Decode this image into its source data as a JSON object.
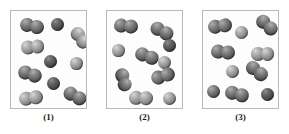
{
  "figure": {
    "kind": "molecular-diagram",
    "background_color": "#ffffff",
    "panel_border_color": "#b9b9b9",
    "panel_fill_color": "#fdfdfd",
    "atom_colors": {
      "medium": "#6a6a6a",
      "light": "#909090",
      "dark": "#4a4a4a"
    },
    "panel_count": 3
  },
  "panels": [
    {
      "id": "panel-1",
      "caption": "(1)",
      "box": {
        "x": 10,
        "y": 10,
        "w": 77,
        "h": 99
      },
      "caption_box": {
        "x": 10,
        "y": 112,
        "w": 77
      },
      "particles": [
        {
          "type": "diatomic",
          "x": 9,
          "y": 8,
          "r": 7.0,
          "angle": 12,
          "shade": "medium"
        },
        {
          "type": "single",
          "x": 40,
          "y": 7,
          "r": 6.6,
          "shade": "dark"
        },
        {
          "type": "diatomic",
          "x": 58,
          "y": 20,
          "r": 6.8,
          "angle": 55,
          "shade": "light"
        },
        {
          "type": "diatomic",
          "x": 10,
          "y": 29,
          "r": 6.8,
          "angle": -5,
          "shade": "light"
        },
        {
          "type": "single",
          "x": 33,
          "y": 44,
          "r": 6.6,
          "shade": "dark"
        },
        {
          "type": "single",
          "x": 59,
          "y": 46,
          "r": 6.4,
          "shade": "light"
        },
        {
          "type": "diatomic",
          "x": 7,
          "y": 56,
          "r": 6.9,
          "angle": 18,
          "shade": "medium"
        },
        {
          "type": "single",
          "x": 36,
          "y": 66,
          "r": 6.6,
          "shade": "dark"
        },
        {
          "type": "diatomic",
          "x": 8,
          "y": 80,
          "r": 6.9,
          "angle": -8,
          "shade": "light"
        },
        {
          "type": "diatomic",
          "x": 52,
          "y": 78,
          "r": 7.0,
          "angle": 28,
          "shade": "medium"
        }
      ]
    },
    {
      "id": "panel-2",
      "caption": "(2)",
      "box": {
        "x": 106,
        "y": 10,
        "w": 77,
        "h": 99
      },
      "caption_box": {
        "x": 106,
        "y": 112,
        "w": 77
      },
      "particles": [
        {
          "type": "diatomic",
          "x": 7,
          "y": 8,
          "r": 7.0,
          "angle": 5,
          "shade": "medium"
        },
        {
          "type": "diatomic",
          "x": 43,
          "y": 13,
          "r": 6.9,
          "angle": 28,
          "shade": "medium"
        },
        {
          "type": "single",
          "x": 5,
          "y": 33,
          "r": 6.4,
          "shade": "light"
        },
        {
          "type": "single",
          "x": 56,
          "y": 28,
          "r": 6.6,
          "shade": "dark"
        },
        {
          "type": "diatomic",
          "x": 28,
          "y": 38,
          "r": 6.9,
          "angle": 20,
          "shade": "medium"
        },
        {
          "type": "single",
          "x": 51,
          "y": 45,
          "r": 6.5,
          "shade": "light"
        },
        {
          "type": "diatomic",
          "x": 44,
          "y": 58,
          "r": 6.9,
          "angle": -18,
          "shade": "medium"
        },
        {
          "type": "diatomic",
          "x": 5,
          "y": 62,
          "r": 6.8,
          "angle": 75,
          "shade": "medium"
        },
        {
          "type": "diatomic",
          "x": 22,
          "y": 80,
          "r": 6.9,
          "angle": 2,
          "shade": "light"
        },
        {
          "type": "single",
          "x": 56,
          "y": 81,
          "r": 6.5,
          "shade": "light"
        }
      ]
    },
    {
      "id": "panel-3",
      "caption": "(3)",
      "box": {
        "x": 202,
        "y": 10,
        "w": 77,
        "h": 99
      },
      "caption_box": {
        "x": 202,
        "y": 112,
        "w": 77
      },
      "particles": [
        {
          "type": "diatomic",
          "x": 5,
          "y": 8,
          "r": 7.0,
          "angle": -8,
          "shade": "medium"
        },
        {
          "type": "single",
          "x": 32,
          "y": 15,
          "r": 6.5,
          "shade": "light"
        },
        {
          "type": "diatomic",
          "x": 52,
          "y": 7,
          "r": 6.9,
          "angle": 42,
          "shade": "medium"
        },
        {
          "type": "diatomic",
          "x": 8,
          "y": 34,
          "r": 6.9,
          "angle": 5,
          "shade": "medium"
        },
        {
          "type": "diatomic",
          "x": 48,
          "y": 36,
          "r": 6.8,
          "angle": 0,
          "shade": "light"
        },
        {
          "type": "single",
          "x": 23,
          "y": 54,
          "r": 6.5,
          "shade": "light"
        },
        {
          "type": "diatomic",
          "x": 42,
          "y": 53,
          "r": 6.9,
          "angle": 38,
          "shade": "medium"
        },
        {
          "type": "single",
          "x": 4,
          "y": 74,
          "r": 6.5,
          "shade": "medium"
        },
        {
          "type": "diatomic",
          "x": 22,
          "y": 76,
          "r": 6.9,
          "angle": 15,
          "shade": "medium"
        },
        {
          "type": "single",
          "x": 58,
          "y": 77,
          "r": 6.5,
          "shade": "dark"
        }
      ]
    }
  ]
}
